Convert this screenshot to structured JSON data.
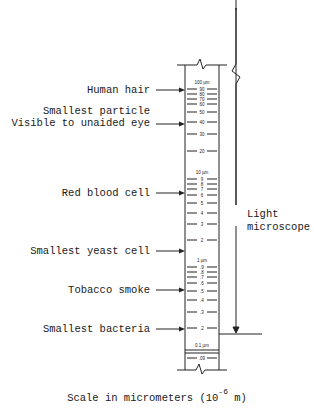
{
  "diagram": {
    "caption": {
      "prefix": "Scale in micrometers (10",
      "exponent": "-6",
      "suffix": " m)"
    },
    "scale": {
      "unit": "µm",
      "major_labels": [
        {
          "text": "100 µm",
          "value": 100,
          "y": 82
        },
        {
          "text": "10 µm",
          "value": 10,
          "y": 172
        },
        {
          "text": "1 µm",
          "value": 1,
          "y": 260
        },
        {
          "text": "0.1 µm",
          "value": 0.1,
          "y": 345
        }
      ],
      "ticks": [
        {
          "text": "90",
          "y": 89
        },
        {
          "text": "80",
          "y": 94
        },
        {
          "text": "70",
          "y": 99
        },
        {
          "text": "60",
          "y": 104
        },
        {
          "text": "50",
          "y": 112
        },
        {
          "text": "40",
          "y": 122
        },
        {
          "text": "30",
          "y": 134
        },
        {
          "text": "20",
          "y": 151
        },
        {
          "text": "9",
          "y": 179
        },
        {
          "text": "8",
          "y": 184
        },
        {
          "text": "7",
          "y": 189
        },
        {
          "text": "6",
          "y": 195
        },
        {
          "text": "5",
          "y": 203
        },
        {
          "text": "4",
          "y": 213
        },
        {
          "text": "3",
          "y": 224
        },
        {
          "text": "2",
          "y": 240
        },
        {
          "text": ".9",
          "y": 267
        },
        {
          "text": ".8",
          "y": 272
        },
        {
          "text": ".7",
          "y": 277
        },
        {
          "text": ".6",
          "y": 283
        },
        {
          "text": ".5",
          "y": 291
        },
        {
          "text": ".4",
          "y": 300
        },
        {
          "text": ".3",
          "y": 312
        },
        {
          "text": ".2",
          "y": 328
        },
        {
          "text": ".09",
          "y": 358
        }
      ]
    },
    "objects": [
      {
        "lines": [
          "Human hair"
        ],
        "y": 90
      },
      {
        "lines": [
          "Smallest particle",
          "Visible to unaided eye"
        ],
        "y": 124
      },
      {
        "lines": [
          "Red blood cell"
        ],
        "y": 193
      },
      {
        "lines": [
          "Smallest yeast cell"
        ],
        "y": 251
      },
      {
        "lines": [
          "Tobacco smoke"
        ],
        "y": 290
      },
      {
        "lines": [
          "Smallest bacteria"
        ],
        "y": 329
      }
    ],
    "range": {
      "label_line1": "Light",
      "label_line2": "microscope"
    }
  }
}
